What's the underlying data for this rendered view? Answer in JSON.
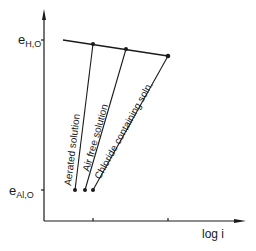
{
  "diagram": {
    "type": "evans-diagram",
    "y_axis": {
      "labels": [
        {
          "main": "e",
          "sub": "H,O",
          "y": 40
        },
        {
          "main": "e",
          "sub": "Al,O",
          "y": 190
        }
      ]
    },
    "x_axis": {
      "label": "log i"
    },
    "curves": [
      {
        "name": "Aerated solution"
      },
      {
        "name": "Air free solution"
      },
      {
        "name": "Chloride containing soln."
      }
    ],
    "colors": {
      "ink": "#1a1a1a",
      "background": "#ffffff"
    }
  }
}
